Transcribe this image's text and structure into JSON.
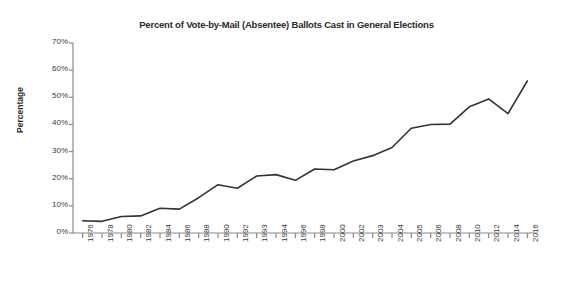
{
  "chart_data": {
    "type": "line",
    "title": "Percent of Vote-by-Mail (Absentee) Ballots Cast in General Elections",
    "xlabel": "",
    "ylabel": "Percentage",
    "categories": [
      "1976",
      "1978",
      "1980",
      "1982",
      "1984",
      "1986",
      "1988",
      "1990",
      "1992",
      "1993",
      "1994",
      "1996",
      "1998",
      "2000",
      "2002",
      "2003",
      "2004",
      "2005",
      "2006",
      "2008",
      "2010",
      "2012",
      "2014",
      "2016"
    ],
    "values": [
      4.5,
      4.3,
      6.1,
      6.3,
      9.1,
      8.8,
      13.0,
      17.8,
      16.5,
      21.0,
      21.5,
      19.4,
      23.6,
      23.3,
      26.5,
      28.5,
      31.5,
      38.6,
      40.0,
      40.1,
      46.5,
      49.4,
      44.0,
      56.0
    ],
    "series": [
      {
        "name": "Percent of vote-by-mail (absentee) ballots cast",
        "values": [
          4.5,
          4.3,
          6.1,
          6.3,
          9.1,
          8.8,
          13.0,
          17.8,
          16.5,
          21.0,
          21.5,
          19.4,
          23.6,
          23.3,
          26.5,
          28.5,
          31.5,
          38.6,
          40.0,
          40.1,
          46.5,
          49.4,
          44.0,
          56.0
        ]
      }
    ],
    "ylim": [
      0,
      70
    ],
    "y_ticks": [
      0,
      10,
      20,
      30,
      40,
      50,
      60,
      70
    ],
    "y_tick_labels": [
      "0%",
      "10%",
      "20%",
      "30%",
      "40%",
      "50%",
      "60%",
      "70%"
    ],
    "grid": false,
    "legend": false,
    "legend_position": "none",
    "line_color": "#333333",
    "axis_color": "#8a8a8a",
    "text_color": "#2b2b2b",
    "background_color": "#ffffff"
  }
}
